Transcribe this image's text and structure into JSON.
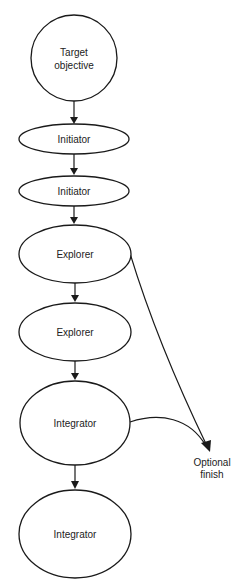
{
  "diagram": {
    "type": "flow-diagram",
    "clipped_title_fragment": "",
    "colors": {
      "stroke": "#1a1a1a",
      "text": "#222222",
      "background": "#ffffff"
    },
    "nodes": [
      {
        "id": "target",
        "shape": "circle",
        "label_lines": [
          "Target",
          "objective"
        ],
        "cx": 74,
        "cy": 58,
        "rx": 43,
        "ry": 43
      },
      {
        "id": "initiator1",
        "shape": "ellipse",
        "label_lines": [
          "Initiator"
        ],
        "cx": 74,
        "cy": 139,
        "rx": 55,
        "ry": 15
      },
      {
        "id": "initiator2",
        "shape": "ellipse",
        "label_lines": [
          "Initiator"
        ],
        "cx": 74,
        "cy": 191,
        "rx": 55,
        "ry": 15
      },
      {
        "id": "explorer1",
        "shape": "ellipse",
        "label_lines": [
          "Explorer"
        ],
        "cx": 75,
        "cy": 254,
        "rx": 56,
        "ry": 29
      },
      {
        "id": "explorer2",
        "shape": "ellipse",
        "label_lines": [
          "Explorer"
        ],
        "cx": 75,
        "cy": 332,
        "rx": 56,
        "ry": 29
      },
      {
        "id": "integrator1",
        "shape": "ellipse",
        "label_lines": [
          "Integrator"
        ],
        "cx": 75,
        "cy": 423,
        "rx": 55,
        "ry": 42
      },
      {
        "id": "integrator2",
        "shape": "ellipse",
        "label_lines": [
          "Integrator"
        ],
        "cx": 75,
        "cy": 534,
        "rx": 56,
        "ry": 44
      }
    ],
    "side_label": {
      "id": "optional-finish",
      "label_lines": [
        "Optional",
        "finish"
      ],
      "x": 212,
      "y": 463
    },
    "edges": [
      {
        "from": "target",
        "to": "initiator1"
      },
      {
        "from": "initiator1",
        "to": "initiator2"
      },
      {
        "from": "initiator2",
        "to": "explorer1"
      },
      {
        "from": "explorer1",
        "to": "explorer2"
      },
      {
        "from": "explorer2",
        "to": "integrator1"
      },
      {
        "from": "integrator1",
        "to": "integrator2"
      },
      {
        "from": "explorer1",
        "to": "optional-finish",
        "curved": true
      },
      {
        "from": "integrator1",
        "to": "optional-finish",
        "curved": true
      }
    ]
  }
}
